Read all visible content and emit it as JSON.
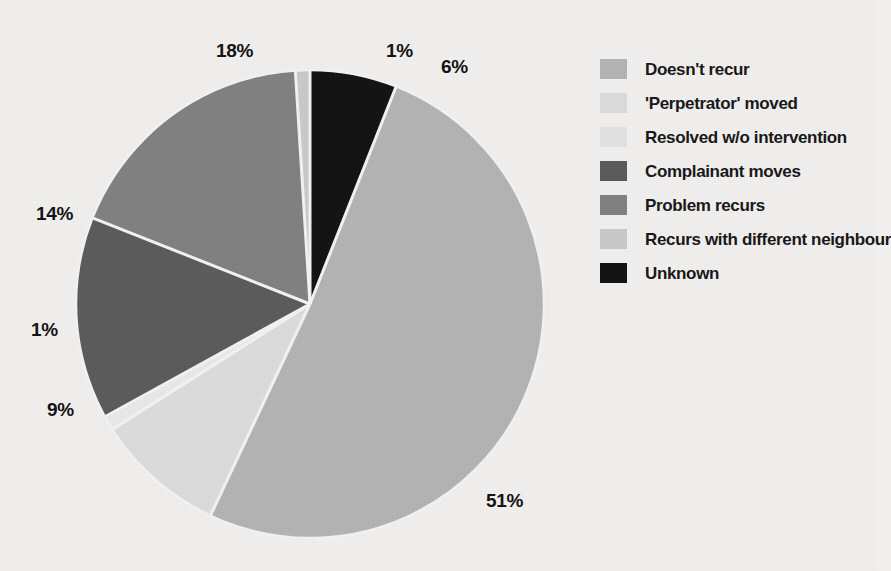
{
  "chart_data": {
    "type": "pie",
    "title": "",
    "subtitle": "",
    "xlabel": "",
    "ylabel": "",
    "legend_position": "right",
    "grid": false,
    "unit": "%",
    "categories": [
      "Doesn't recur",
      "'Perpetrator' moved",
      "Resolved w/o intervention",
      "Complainant moves",
      "Problem recurs",
      "Recurs with different neighbour",
      "Unknown"
    ],
    "values": [
      51,
      9,
      1,
      14,
      18,
      1,
      6
    ],
    "colors": [
      "#b3b3b3",
      "#dcdcdc",
      "#e9e9e9",
      "#5a5a5a",
      "#808080",
      "#c9c9c9",
      "#111111"
    ],
    "slice_order_clockwise_from_top": [
      {
        "label": "Unknown",
        "value": 6,
        "color": "#111111",
        "start_deg": 0,
        "end_deg": 21.6,
        "pct_text": "6%"
      },
      {
        "label": "Doesn't recur",
        "value": 51,
        "color": "#b3b3b3",
        "start_deg": 21.6,
        "end_deg": 205.2,
        "pct_text": "51%"
      },
      {
        "label": "'Perpetrator' moved",
        "value": 9,
        "color": "#dcdcdc",
        "start_deg": 205.2,
        "end_deg": 237.6,
        "pct_text": "9%"
      },
      {
        "label": "Resolved w/o intervention",
        "value": 1,
        "color": "#e9e9e9",
        "start_deg": 237.6,
        "end_deg": 241.2,
        "pct_text": "1%"
      },
      {
        "label": "Complainant moves",
        "value": 14,
        "color": "#5a5a5a",
        "start_deg": 241.2,
        "end_deg": 291.6,
        "pct_text": "14%"
      },
      {
        "label": "Problem recurs",
        "value": 18,
        "color": "#808080",
        "start_deg": 291.6,
        "end_deg": 356.4,
        "pct_text": "18%"
      },
      {
        "label": "Recurs with different neighbour",
        "value": 1,
        "color": "#c9c9c9",
        "start_deg": 356.4,
        "end_deg": 360,
        "pct_text": "1%"
      }
    ]
  },
  "pie": {
    "center_x": 310,
    "center_y": 304,
    "radius": 234,
    "separator_color": "#f4f3f1",
    "separator_width": 3
  },
  "labels": [
    {
      "id": "pct-18",
      "text": "18%",
      "x": 216,
      "y": 41
    },
    {
      "id": "pct-1-top",
      "text": "1%",
      "x": 386,
      "y": 41
    },
    {
      "id": "pct-6",
      "text": "6%",
      "x": 441,
      "y": 57
    },
    {
      "id": "pct-14",
      "text": "14%",
      "x": 36,
      "y": 204
    },
    {
      "id": "pct-1-left",
      "text": "1%",
      "x": 31,
      "y": 320
    },
    {
      "id": "pct-9",
      "text": "9%",
      "x": 47,
      "y": 400
    },
    {
      "id": "pct-51",
      "text": "51%",
      "x": 486,
      "y": 491
    }
  ],
  "legend": {
    "items": [
      {
        "label": "Doesn't recur",
        "color": "#b3b3b3",
        "swatch_name": "legend-swatch-doesnt-recur"
      },
      {
        "label": "'Perpetrator' moved",
        "color": "#dcdcdc",
        "swatch_name": "legend-swatch-perpetrator-moved"
      },
      {
        "label": "Resolved w/o intervention",
        "color": "#e2e2e2",
        "swatch_name": "legend-swatch-resolved-wo-intervention"
      },
      {
        "label": "Complainant moves",
        "color": "#5a5a5a",
        "swatch_name": "legend-swatch-complainant-moves"
      },
      {
        "label": "Problem recurs",
        "color": "#808080",
        "swatch_name": "legend-swatch-problem-recurs"
      },
      {
        "label": "Recurs with different neighbour",
        "color": "#c9c9c9",
        "swatch_name": "legend-swatch-recurs-different-neighbour"
      },
      {
        "label": "Unknown",
        "color": "#111111",
        "swatch_name": "legend-swatch-unknown"
      }
    ]
  },
  "theme": {
    "background": "#f1f0ee",
    "text_color": "#161616"
  }
}
